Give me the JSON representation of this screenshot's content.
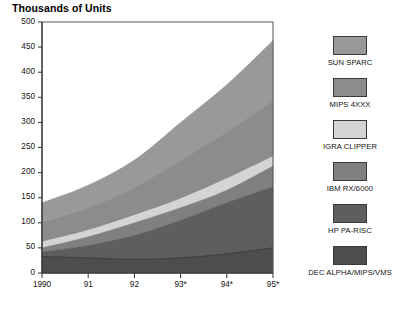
{
  "chart_data": {
    "type": "area",
    "title": "Thousands of Units",
    "subtitle": "",
    "xlabel": "",
    "ylabel": "Thousands of Units",
    "stacked": true,
    "grid": false,
    "legend_position": "right",
    "categories": [
      "1990",
      "91",
      "92",
      "93*",
      "94*",
      "95*"
    ],
    "x_tick_labels": [
      "1990",
      "91",
      "92",
      "93*",
      "94*",
      "95*"
    ],
    "y_tick_labels": [
      "0",
      "50",
      "100",
      "150",
      "200",
      "250",
      "300",
      "350",
      "400",
      "450",
      "500"
    ],
    "y_ticks": [
      0,
      50,
      100,
      150,
      200,
      250,
      300,
      350,
      400,
      450,
      500
    ],
    "ylim": [
      0,
      500
    ],
    "series": [
      {
        "name": "DEC ALPHA/MIPS/VMS",
        "color": "#4d4d4d",
        "values": [
          33,
          30,
          27,
          30,
          38,
          50
        ]
      },
      {
        "name": "HP PA-RISC",
        "color": "#5e5e5e",
        "values": [
          9,
          25,
          48,
          75,
          102,
          122
        ]
      },
      {
        "name": "IBM RX/6000",
        "color": "#808080",
        "values": [
          8,
          17,
          25,
          25,
          25,
          41
        ]
      },
      {
        "name": "IGRA CLIPPER",
        "color": "#d4d4d4",
        "values": [
          12,
          13,
          15,
          18,
          23,
          19
        ]
      },
      {
        "name": "MIPS 4XXX",
        "color": "#8c8c8c",
        "values": [
          39,
          45,
          55,
          76,
          93,
          111
        ]
      },
      {
        "name": "SUN SPARC",
        "color": "#999999",
        "values": [
          39,
          45,
          55,
          76,
          94,
          120
        ]
      }
    ],
    "cumulative_totals": [
      140,
      175,
      225,
      300,
      375,
      463
    ],
    "annotations": []
  },
  "legend": {
    "items": [
      {
        "label": "SUN SPARC",
        "color": "#999999"
      },
      {
        "label": "MIPS 4XXX",
        "color": "#8c8c8c"
      },
      {
        "label": "IGRA CLIPPER",
        "color": "#d4d4d4"
      },
      {
        "label": "IBM RX/6000",
        "color": "#808080"
      },
      {
        "label": "HP PA-RISC",
        "color": "#5e5e5e"
      },
      {
        "label": "DEC ALPHA/MIPS/VMS",
        "color": "#4d4d4d"
      }
    ]
  },
  "colors": {
    "axis": "#555555",
    "text": "#111111",
    "background": "#ffffff"
  }
}
